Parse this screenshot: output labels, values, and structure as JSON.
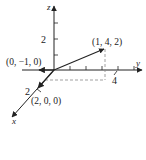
{
  "diagram": {
    "type": "3d-coordinate-vectors",
    "axes": {
      "x_label": "x",
      "y_label": "y",
      "z_label": "z"
    },
    "tick_labels": {
      "z_tick": "2",
      "y_tick": "4",
      "x_tick": "2"
    },
    "points": {
      "p1": "(1, 4, 2)",
      "p2": "(0, −1, 0)",
      "p3": "(2, 0, 0)"
    },
    "colors": {
      "line": "#333333",
      "dashed": "#888888",
      "background": "#ffffff"
    }
  }
}
